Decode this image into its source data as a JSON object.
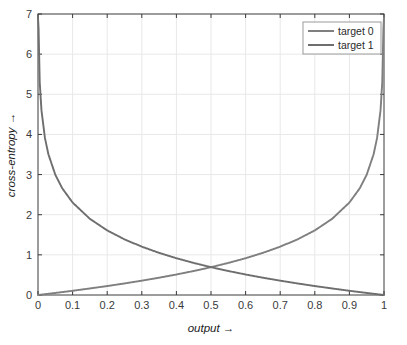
{
  "chart_data": {
    "type": "line",
    "title": "",
    "xlabel": "output →",
    "ylabel": "cross-entropy →",
    "xlim": [
      0,
      1
    ],
    "ylim": [
      0,
      7
    ],
    "grid": true,
    "legend_position": "top-right",
    "xticks": [
      "0",
      "0.1",
      "0.2",
      "0.3",
      "0.4",
      "0.5",
      "0.6",
      "0.7",
      "0.8",
      "0.9",
      "1"
    ],
    "xtick_values": [
      0,
      0.1,
      0.2,
      0.3,
      0.4,
      0.5,
      0.6,
      0.7,
      0.8,
      0.9,
      1
    ],
    "yticks": [
      "0",
      "1",
      "2",
      "3",
      "4",
      "5",
      "6",
      "7"
    ],
    "ytick_values": [
      0,
      1,
      2,
      3,
      4,
      5,
      6,
      7
    ],
    "series": [
      {
        "name": "target 0",
        "formula": "-ln(1 - output)",
        "color": "#7f7f7f",
        "x": [
          0.0,
          0.02,
          0.05,
          0.1,
          0.15,
          0.2,
          0.25,
          0.3,
          0.35,
          0.4,
          0.45,
          0.5,
          0.55,
          0.6,
          0.65,
          0.7,
          0.75,
          0.8,
          0.85,
          0.9,
          0.93,
          0.95,
          0.97,
          0.98,
          0.99,
          0.995,
          0.999
        ],
        "values": [
          0.0,
          0.02,
          0.051,
          0.105,
          0.163,
          0.223,
          0.288,
          0.357,
          0.431,
          0.511,
          0.598,
          0.693,
          0.799,
          0.916,
          1.05,
          1.204,
          1.386,
          1.609,
          1.897,
          2.303,
          2.659,
          2.996,
          3.507,
          3.912,
          4.605,
          5.298,
          6.908
        ]
      },
      {
        "name": "target 1",
        "formula": "-ln(output)",
        "color": "#6e6e6e",
        "x": [
          0.001,
          0.005,
          0.01,
          0.02,
          0.03,
          0.05,
          0.07,
          0.1,
          0.15,
          0.2,
          0.25,
          0.3,
          0.35,
          0.4,
          0.45,
          0.5,
          0.55,
          0.6,
          0.65,
          0.7,
          0.75,
          0.8,
          0.85,
          0.9,
          0.95,
          0.98,
          1.0
        ],
        "values": [
          6.908,
          5.298,
          4.605,
          3.912,
          3.507,
          2.996,
          2.659,
          2.303,
          1.897,
          1.609,
          1.386,
          1.204,
          1.05,
          0.916,
          0.799,
          0.693,
          0.598,
          0.511,
          0.431,
          0.357,
          0.288,
          0.223,
          0.163,
          0.105,
          0.051,
          0.02,
          0.0
        ]
      }
    ],
    "crossing_point": {
      "x": 0.5,
      "y": 0.693
    }
  },
  "legend": {
    "entries": [
      {
        "label": "target 0"
      },
      {
        "label": "target 1"
      }
    ]
  },
  "colors": {
    "axis": "#3a3a3a",
    "grid": "#e8e8e8",
    "curve_target0": "#7f7f7f",
    "curve_target1": "#6e6e6e",
    "background": "#ffffff",
    "legend_border": "#9a9a9a"
  }
}
